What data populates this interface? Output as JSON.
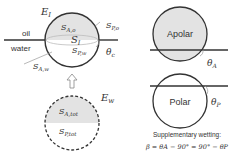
{
  "left_panel": {
    "top_particle": {
      "energy_label": "E",
      "energy_sub": "I",
      "oil_label": "oil",
      "water_label": "water",
      "s_ao": {
        "main": "S",
        "sub": "A,o"
      },
      "s_po": {
        "main": "S",
        "sub": "P,o"
      },
      "s_i": {
        "main": "S",
        "sub": "I"
      },
      "s_pw": {
        "main": "S",
        "sub": "P,w"
      },
      "s_aw": {
        "main": "S",
        "sub": "A,w"
      },
      "theta": {
        "main": "θ",
        "sub": "c"
      }
    },
    "arrow": "up-hollow-arrow",
    "bottom_particle": {
      "energy_label": "E",
      "energy_sub": "w",
      "s_atot": {
        "main": "S",
        "sub": "A,tot"
      },
      "s_ptot": {
        "main": "S",
        "sub": "P,tot"
      }
    }
  },
  "right_panel": {
    "apolar": {
      "label": "Apolar",
      "theta": {
        "main": "θ",
        "sub": "A"
      }
    },
    "polar": {
      "label": "Polar",
      "theta": {
        "main": "θ",
        "sub": "P"
      }
    },
    "caption": "Supplementary wetting:",
    "equation": "β = θA − 90° = 90° − θP"
  },
  "colors": {
    "gray_fill": "#e3e3e3",
    "stroke": "#333333",
    "light_line": "#aaaaaa"
  }
}
